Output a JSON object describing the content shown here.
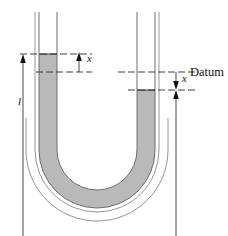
{
  "figure": {
    "type": "u-tube-manometer-diagram",
    "title": "",
    "background_color": "#ffffff",
    "fluid_color": "#b9b9b9",
    "outline_color": "#6e6e6e",
    "annotation_color": "#111111"
  },
  "labels": {
    "datum": "Datum",
    "displacement_left": "x",
    "displacement_right": "x",
    "length": "l"
  },
  "geometry": {
    "left_tube": {
      "inner_left_x": 39,
      "inner_right_x": 57,
      "wall_outer_left_x": 35,
      "top_y": 12,
      "fluid_surface_y": 54,
      "datum_y": 72
    },
    "right_tube": {
      "inner_left_x": 137,
      "inner_right_x": 155,
      "wall_outer_right_x": 159,
      "top_y": 12,
      "datum_y": 72,
      "fluid_surface_y": 90
    },
    "bend": {
      "center_x": 97,
      "center_y": 150,
      "outer_radius": 85,
      "inner_radius": 40
    }
  },
  "dimensions": {
    "x_left": {
      "label": "x",
      "from_y": 72,
      "to_y": 54,
      "arrow_direction": "up",
      "line_x": 79
    },
    "x_right": {
      "label": "x",
      "from_y": 72,
      "to_y": 90,
      "arrow_direction": "down",
      "line_x": 176
    },
    "ell": {
      "label": "l",
      "from_y": 54,
      "to_y": 236,
      "arrow_direction": "down",
      "line_x": 23
    }
  },
  "datum_lines": {
    "left_dash_from_x": 20,
    "left_dash_to_x": 92,
    "right_dash_from_x": 118,
    "right_dash_to_x": 196
  }
}
